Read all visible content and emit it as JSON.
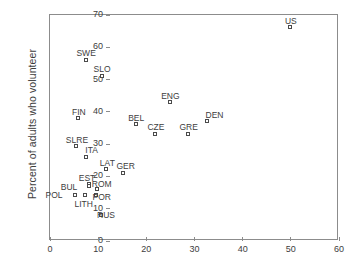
{
  "chart_data": {
    "type": "scatter",
    "title": "",
    "xlabel": "",
    "ylabel": "Percent of adults who volunteer",
    "xlim": [
      0,
      60
    ],
    "ylim": [
      0,
      70
    ],
    "xticks": [
      0,
      10,
      20,
      30,
      40,
      50,
      60
    ],
    "yticks": [
      0,
      10,
      20,
      30,
      40,
      50,
      60,
      70
    ],
    "grid": false,
    "legend": "none",
    "marker": "open-square",
    "points": [
      {
        "label": "US",
        "x": 50.0,
        "y": 66.0,
        "lx": 0,
        "ly": -11
      },
      {
        "label": "SWE",
        "x": 7.5,
        "y": 56.0,
        "lx": 0,
        "ly": -11
      },
      {
        "label": "SLO",
        "x": 10.8,
        "y": 51.0,
        "lx": 0,
        "ly": -11
      },
      {
        "label": "ENG",
        "x": 25.0,
        "y": 42.8,
        "lx": 0,
        "ly": -11
      },
      {
        "label": "FIN",
        "x": 6.0,
        "y": 37.8,
        "lx": 0,
        "ly": -11
      },
      {
        "label": "DEN",
        "x": 32.7,
        "y": 37.0,
        "lx": 7,
        "ly": -11
      },
      {
        "label": "BEL",
        "x": 17.9,
        "y": 36.0,
        "lx": 0,
        "ly": -11
      },
      {
        "label": "CZE",
        "x": 22.0,
        "y": 33.0,
        "lx": 0,
        "ly": -11
      },
      {
        "label": "GRE",
        "x": 28.8,
        "y": 33.0,
        "lx": 0,
        "ly": -11
      },
      {
        "label": "SLRE",
        "x": 5.6,
        "y": 29.2,
        "lx": 0,
        "ly": -11
      },
      {
        "label": "ITA",
        "x": 7.6,
        "y": 26.0,
        "lx": 5,
        "ly": -11
      },
      {
        "label": "LAT",
        "x": 11.7,
        "y": 22.0,
        "lx": 1,
        "ly": -11
      },
      {
        "label": "GER",
        "x": 15.3,
        "y": 21.0,
        "lx": 2,
        "ly": -11
      },
      {
        "label": "EST",
        "x": 8.1,
        "y": 17.5,
        "lx": -2,
        "ly": -11
      },
      {
        "label": "ROM",
        "x": 9.9,
        "y": 15.8,
        "lx": 4,
        "ly": -10
      },
      {
        "label": "BUL",
        "x": 8.1,
        "y": 16.8,
        "lx": -20,
        "ly": -4
      },
      {
        "label": "POL",
        "x": 5.2,
        "y": 14.2,
        "lx": -21,
        "ly": -4
      },
      {
        "label": "LITH",
        "x": 7.4,
        "y": 14.0,
        "lx": -2,
        "ly": 4
      },
      {
        "label": "POR",
        "x": 9.7,
        "y": 14.0,
        "lx": 5,
        "ly": -3
      },
      {
        "label": "RUS",
        "x": 10.6,
        "y": 8.0,
        "lx": 5,
        "ly": -4
      }
    ]
  }
}
